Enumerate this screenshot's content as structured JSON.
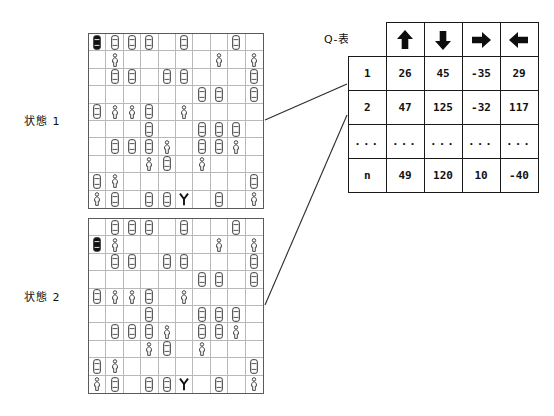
{
  "figure": {
    "state1_label": "状態 1",
    "state2_label": "状態 2",
    "qtable_label": "Q-表"
  },
  "qtable": {
    "columns": [
      {
        "name": "up-arrow-icon",
        "label": "↑"
      },
      {
        "name": "down-arrow-icon",
        "label": "↓"
      },
      {
        "name": "right-arrow-icon",
        "label": "→"
      },
      {
        "name": "left-arrow-icon",
        "label": "←"
      }
    ],
    "rows": [
      {
        "label": "1",
        "values": [
          "26",
          "45",
          "-35",
          "29"
        ]
      },
      {
        "label": "2",
        "values": [
          "47",
          "125",
          "-32",
          "117"
        ]
      },
      {
        "label": "...",
        "values": [
          "...",
          "...",
          "...",
          "..."
        ]
      },
      {
        "label": "n",
        "values": [
          "49",
          "120",
          "10",
          "-40"
        ]
      }
    ]
  },
  "grids": {
    "size": 10,
    "legend": {
      "car": "car-icon",
      "car_filled": "ego-car-icon",
      "person": "pedestrian-icon",
      "tree": "tree-icon",
      "empty": "empty-cell"
    },
    "state1": [
      [
        "car_filled",
        "car",
        "car",
        "car",
        "empty",
        "car",
        "empty",
        "empty",
        "car",
        "empty"
      ],
      [
        "empty",
        "person",
        "empty",
        "empty",
        "empty",
        "empty",
        "empty",
        "person",
        "empty",
        "person"
      ],
      [
        "empty",
        "car",
        "car",
        "empty",
        "car",
        "car",
        "empty",
        "empty",
        "empty",
        "car"
      ],
      [
        "empty",
        "empty",
        "empty",
        "empty",
        "empty",
        "empty",
        "car",
        "car",
        "empty",
        "car"
      ],
      [
        "car",
        "person",
        "person",
        "car",
        "empty",
        "person",
        "empty",
        "empty",
        "empty",
        "empty"
      ],
      [
        "empty",
        "empty",
        "empty",
        "car",
        "empty",
        "empty",
        "car",
        "car",
        "car",
        "empty"
      ],
      [
        "empty",
        "car",
        "car",
        "car",
        "person",
        "empty",
        "car",
        "car",
        "person",
        "empty"
      ],
      [
        "empty",
        "empty",
        "empty",
        "person",
        "car",
        "empty",
        "person",
        "empty",
        "empty",
        "empty"
      ],
      [
        "car",
        "person",
        "empty",
        "empty",
        "empty",
        "empty",
        "empty",
        "empty",
        "empty",
        "car"
      ],
      [
        "person",
        "car",
        "empty",
        "car",
        "car",
        "tree",
        "empty",
        "car",
        "empty",
        "person"
      ]
    ],
    "state2": [
      [
        "empty",
        "car",
        "car",
        "car",
        "empty",
        "car",
        "empty",
        "empty",
        "car",
        "empty"
      ],
      [
        "car_filled",
        "person",
        "empty",
        "empty",
        "empty",
        "empty",
        "empty",
        "person",
        "empty",
        "person"
      ],
      [
        "empty",
        "car",
        "car",
        "empty",
        "car",
        "car",
        "empty",
        "empty",
        "empty",
        "car"
      ],
      [
        "empty",
        "empty",
        "empty",
        "empty",
        "empty",
        "empty",
        "car",
        "car",
        "empty",
        "car"
      ],
      [
        "car",
        "person",
        "person",
        "car",
        "empty",
        "person",
        "empty",
        "empty",
        "empty",
        "empty"
      ],
      [
        "empty",
        "empty",
        "empty",
        "car",
        "empty",
        "empty",
        "car",
        "car",
        "car",
        "empty"
      ],
      [
        "empty",
        "car",
        "car",
        "car",
        "person",
        "empty",
        "car",
        "car",
        "person",
        "empty"
      ],
      [
        "empty",
        "empty",
        "empty",
        "person",
        "car",
        "empty",
        "person",
        "empty",
        "empty",
        "empty"
      ],
      [
        "car",
        "person",
        "empty",
        "empty",
        "empty",
        "empty",
        "empty",
        "empty",
        "empty",
        "car"
      ],
      [
        "person",
        "car",
        "empty",
        "car",
        "car",
        "tree",
        "empty",
        "car",
        "empty",
        "person"
      ]
    ]
  }
}
